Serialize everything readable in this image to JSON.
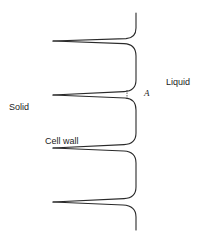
{
  "figure": {
    "labels": {
      "solid": "Solid",
      "liquid": "Liquid",
      "cell_wall": "Cell wall",
      "point_a": "A"
    },
    "colors": {
      "stroke": "#2a2a2a",
      "text": "#222222",
      "background": "#ffffff"
    },
    "geometry": {
      "interface_x": 136,
      "groove_tip_x": 53,
      "groove_tips_y": [
        41,
        95,
        148,
        202
      ],
      "top_y": 13,
      "bottom_y": 230
    }
  }
}
